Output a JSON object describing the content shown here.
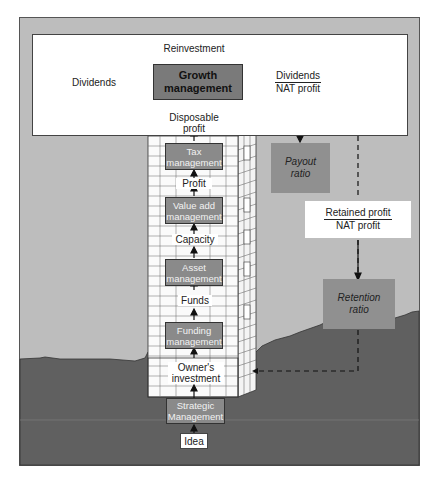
{
  "diagram": {
    "colors": {
      "frame": "#bdbdbd",
      "ground": "#606060",
      "box": "#7a7a7a",
      "white": "#ffffff",
      "line": "#111111"
    },
    "top_section": {
      "central_box": "Growth\nmanagement",
      "central_box_line1": "Growth",
      "central_box_line2": "management",
      "top_output": "Reinvestment",
      "left_output": "Dividends",
      "right_ratio": {
        "numerator": "Dividends",
        "denominator": "NAT profit"
      },
      "input": "Disposable\nprofit",
      "input_line1": "Disposable",
      "input_line2": "profit"
    },
    "building_stack": [
      {
        "type": "box",
        "line1": "Tax",
        "line2": "management"
      },
      {
        "type": "label",
        "text": "Profit"
      },
      {
        "type": "box",
        "line1": "Value add",
        "line2": "management"
      },
      {
        "type": "label",
        "text": "Capacity"
      },
      {
        "type": "box",
        "line1": "Asset",
        "line2": "management"
      },
      {
        "type": "label",
        "text": "Funds"
      },
      {
        "type": "box",
        "line1": "Funding",
        "line2": "management"
      },
      {
        "type": "label",
        "line1": "Owner's",
        "line2": "investment"
      }
    ],
    "foundation": {
      "box": {
        "line1": "Strategic",
        "line2": "Management"
      },
      "root": "Idea"
    },
    "right_side": {
      "payout_ratio": {
        "line1": "Payout",
        "line2": "ratio"
      },
      "retention_fraction": {
        "numerator": "Retained profit",
        "denominator": "NAT profit"
      },
      "retention_ratio": {
        "line1": "Retention",
        "line2": "ratio"
      }
    }
  }
}
